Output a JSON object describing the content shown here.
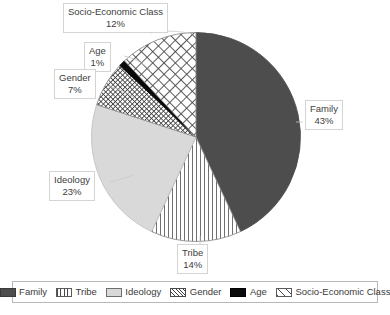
{
  "chart_data": {
    "type": "pie",
    "title": "",
    "subtitle": "",
    "xlabel": "",
    "ylabel": "",
    "legend_position": "bottom",
    "grid": false,
    "labels_show_percent": true,
    "total_percent": 100,
    "categories": [
      "Family",
      "Tribe",
      "Ideology",
      "Gender",
      "Age",
      "Socio-Economic Class"
    ],
    "values": [
      43,
      14,
      23,
      7,
      1,
      12
    ],
    "slices": [
      {
        "label": "Family",
        "value": 43,
        "value_text": "43%",
        "fill_style": "solid-dark-gray",
        "color": "#4d4d4d",
        "start_angle_deg": 0,
        "end_angle_deg": 154.8
      },
      {
        "label": "Tribe",
        "value": 14,
        "value_text": "14%",
        "fill_style": "vertical-lines",
        "color": "#ffffff",
        "start_angle_deg": 154.8,
        "end_angle_deg": 205.2
      },
      {
        "label": "Ideology",
        "value": 23,
        "value_text": "23%",
        "fill_style": "solid-light-gray",
        "color": "#d9d9d9",
        "start_angle_deg": 205.2,
        "end_angle_deg": 288.0
      },
      {
        "label": "Gender",
        "value": 7,
        "value_text": "7%",
        "fill_style": "fine-checker",
        "color": "#ffffff",
        "start_angle_deg": 288.0,
        "end_angle_deg": 313.2
      },
      {
        "label": "Age",
        "value": 1,
        "value_text": "1%",
        "fill_style": "solid-black",
        "color": "#0a0a0a",
        "start_angle_deg": 313.2,
        "end_angle_deg": 316.8
      },
      {
        "label": "Socio-Economic Class",
        "value": 12,
        "value_text": "12%",
        "fill_style": "diagonal-crosshatch",
        "color": "#ffffff",
        "start_angle_deg": 316.8,
        "end_angle_deg": 360
      }
    ]
  },
  "callouts": {
    "socio": {
      "name": "Socio-Economic Class",
      "value": "12%"
    },
    "age": {
      "name": "Age",
      "value": "1%"
    },
    "gender": {
      "name": "Gender",
      "value": "7%"
    },
    "ideology": {
      "name": "Ideology",
      "value": "23%"
    },
    "tribe": {
      "name": "Tribe",
      "value": "14%"
    },
    "family": {
      "name": "Family",
      "value": "43%"
    }
  },
  "legend": {
    "items": [
      {
        "label": "Family",
        "swatch": "solid-dark-gray"
      },
      {
        "label": "Tribe",
        "swatch": "vertical-lines"
      },
      {
        "label": "Ideology",
        "swatch": "solid-light-gray"
      },
      {
        "label": "Gender",
        "swatch": "fine-checker"
      },
      {
        "label": "Age",
        "swatch": "solid-black"
      },
      {
        "label": "Socio-Economic Class",
        "swatch": "diagonal-crosshatch"
      }
    ]
  }
}
